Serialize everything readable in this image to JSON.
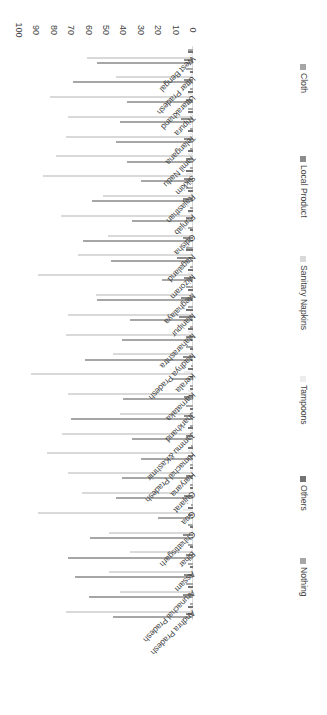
{
  "chart_data": {
    "type": "bar",
    "orientation": "horizontal-grouped",
    "title": "",
    "xlabel": "",
    "ylabel": "",
    "xlim": [
      0,
      100
    ],
    "xticks": [
      0,
      10,
      20,
      30,
      40,
      50,
      60,
      70,
      80,
      90,
      100
    ],
    "grid": false,
    "legend_position": "right",
    "rotation_deg": 180,
    "categories": [
      "Andhra Pradesh",
      "Arunachal Pradesh",
      "Assam",
      "Bihar",
      "Chhattisgarh",
      "Goa",
      "Gujarat",
      "Haryana",
      "Himachal Pradesh",
      "Jammu &Kashmir",
      "Jharkhand",
      "Karnataka",
      "Kerala",
      "Madhya Pradesh",
      "Maharashtra",
      "Manipur",
      "Meghalaya",
      "Mizoram",
      "Nagaland",
      "Odisha",
      "Punjab",
      "Rajasthan",
      "Sikkim",
      "Tamil Nadu",
      "Telangana",
      "Tripura",
      "Uttarakhand",
      "Uttar Pradesh",
      "West Bengal"
    ],
    "series": [
      {
        "name": "Cloth",
        "color": "#a6a6a6",
        "values": [
          46,
          60,
          68,
          72,
          59,
          20,
          44,
          41,
          30,
          35,
          70,
          40,
          12,
          62,
          41,
          36,
          55,
          18,
          47,
          63,
          35,
          58,
          30,
          38,
          44,
          42,
          38,
          69,
          55
        ]
      },
      {
        "name": "Local Product",
        "color": "#8c8c8c",
        "values": [
          4,
          6,
          5,
          4,
          6,
          3,
          5,
          4,
          3,
          4,
          5,
          5,
          2,
          6,
          4,
          8,
          7,
          5,
          9,
          6,
          4,
          6,
          5,
          4,
          5,
          7,
          4,
          5,
          5
        ]
      },
      {
        "name": "Sanitary Napkins",
        "color": "#d9d9d9",
        "values": [
          73,
          42,
          48,
          36,
          48,
          89,
          64,
          72,
          84,
          75,
          42,
          72,
          93,
          46,
          73,
          72,
          56,
          89,
          66,
          49,
          76,
          52,
          86,
          79,
          73,
          72,
          82,
          44,
          61
        ]
      },
      {
        "name": "Tampoons",
        "color": "#ededed",
        "values": [
          2,
          2,
          1,
          1,
          1,
          6,
          2,
          2,
          3,
          2,
          1,
          3,
          5,
          1,
          3,
          2,
          2,
          3,
          2,
          1,
          3,
          2,
          4,
          3,
          2,
          2,
          3,
          1,
          2
        ]
      },
      {
        "name": "Others",
        "color": "#737373",
        "values": [
          3,
          3,
          2,
          2,
          2,
          3,
          2,
          2,
          3,
          3,
          2,
          2,
          3,
          2,
          3,
          4,
          3,
          3,
          4,
          2,
          3,
          3,
          4,
          3,
          3,
          3,
          3,
          2,
          3
        ]
      },
      {
        "name": "Nothing",
        "color": "#a6a6a6",
        "values": [
          2,
          4,
          3,
          3,
          3,
          1,
          2,
          2,
          1,
          2,
          4,
          2,
          1,
          4,
          2,
          3,
          4,
          2,
          4,
          3,
          2,
          4,
          2,
          2,
          2,
          3,
          2,
          4,
          3
        ]
      }
    ]
  },
  "legend": {
    "items": [
      {
        "label": "Cloth",
        "color": "#a6a6a6"
      },
      {
        "label": "Local Product",
        "color": "#8c8c8c"
      },
      {
        "label": "Sanitary Napkins",
        "color": "#d9d9d9"
      },
      {
        "label": "Tampoons",
        "color": "#ededed"
      },
      {
        "label": "Others",
        "color": "#737373"
      },
      {
        "label": "Nothing",
        "color": "#a6a6a6"
      }
    ]
  }
}
